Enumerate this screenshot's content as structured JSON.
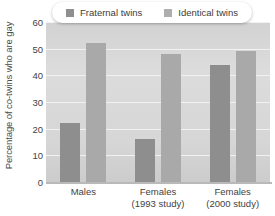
{
  "chart_data": {
    "type": "bar",
    "title": "",
    "xlabel": "",
    "ylabel": "Percentage of co-twins who are gay",
    "categories": [
      "Males",
      "Females\n(1993 study)",
      "Females\n(2000 study)"
    ],
    "category_lines": [
      {
        "line1": "Males",
        "line2": ""
      },
      {
        "line1": "Females",
        "line2": "(1993 study)"
      },
      {
        "line1": "Females",
        "line2": "(2000 study)"
      }
    ],
    "series": [
      {
        "name": "Fraternal twins",
        "values": [
          22,
          16,
          44
        ],
        "color": "#8e8e8e"
      },
      {
        "name": "Identical twins",
        "values": [
          52,
          48,
          49
        ],
        "color": "#a9a9a9"
      }
    ],
    "ylim": [
      0,
      60
    ],
    "yticks": [
      0,
      10,
      20,
      30,
      40,
      50,
      60
    ],
    "ytick_labels": [
      "0",
      "10",
      "20",
      "30",
      "40",
      "50",
      "60"
    ],
    "grid": true,
    "legend_position": "top-center"
  },
  "legend": {
    "entries": [
      {
        "label": "Fraternal twins",
        "swatch": "fraternal-swatch"
      },
      {
        "label": "Identical twins",
        "swatch": "identical-swatch"
      }
    ]
  }
}
